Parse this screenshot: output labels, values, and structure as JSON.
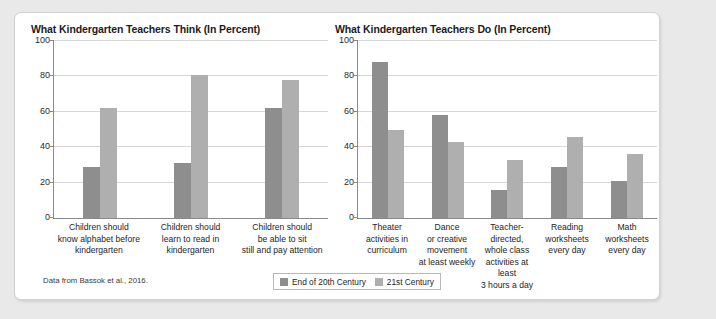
{
  "panel": {
    "source_note": "Data from Bassok et al., 2016."
  },
  "legend": {
    "series": [
      {
        "label": "End of 20th Century",
        "color": "#8e8e8e"
      },
      {
        "label": "21st Century",
        "color": "#afafaf"
      }
    ]
  },
  "chart_data": [
    {
      "type": "bar",
      "id": "teachers-think",
      "title": "What Kindergarten Teachers Think (In Percent)",
      "xlabel": "",
      "ylabel": "",
      "ylim": [
        0,
        100
      ],
      "yticks": [
        0,
        20,
        40,
        60,
        80,
        100
      ],
      "grid": true,
      "legend_position": "bottom-center",
      "categories": [
        "Children should know alphabet before kindergarten",
        "Children should learn to read in kindergarten",
        "Children should be able to sit still and pay attention"
      ],
      "category_lines": [
        [
          "Children should",
          "know alphabet before",
          "kindergarten"
        ],
        [
          "Children should",
          "learn to read in",
          "kindergarten"
        ],
        [
          "Children should",
          "be able to sit",
          "still and pay attention"
        ]
      ],
      "series": [
        {
          "name": "End of 20th Century",
          "values": [
            29,
            31,
            62
          ]
        },
        {
          "name": "21st Century",
          "values": [
            62,
            81,
            78
          ]
        }
      ]
    },
    {
      "type": "bar",
      "id": "teachers-do",
      "title": "What Kindergarten Teachers Do (In Percent)",
      "xlabel": "",
      "ylabel": "",
      "ylim": [
        0,
        100
      ],
      "yticks": [
        0,
        20,
        40,
        60,
        80,
        100
      ],
      "grid": true,
      "legend_position": "bottom-center",
      "categories": [
        "Theater activities in curriculum",
        "Dance or creative movement at least weekly",
        "Teacher-directed, whole class activities at least 3 hours a day",
        "Reading worksheets every day",
        "Math worksheets every day"
      ],
      "category_lines": [
        [
          "Theater",
          "activities in",
          "curriculum"
        ],
        [
          "Dance",
          "or creative",
          "movement",
          "at least weekly"
        ],
        [
          "Teacher-directed,",
          "whole class",
          "activities at least",
          "3 hours a day"
        ],
        [
          "Reading",
          "worksheets",
          "every day"
        ],
        [
          "Math",
          "worksheets",
          "every day"
        ]
      ],
      "series": [
        {
          "name": "End of 20th Century",
          "values": [
            88,
            58,
            16,
            29,
            21
          ]
        },
        {
          "name": "21st Century",
          "values": [
            50,
            43,
            33,
            46,
            36
          ]
        }
      ]
    }
  ]
}
